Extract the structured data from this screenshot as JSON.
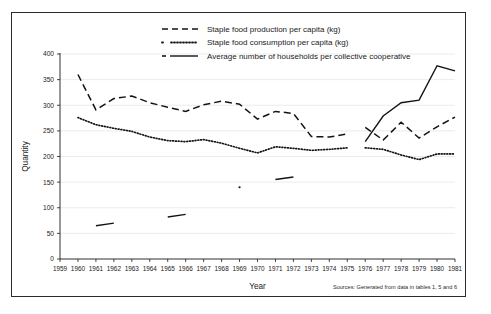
{
  "figure": {
    "axis_titles": {
      "x": "Year",
      "y": "Quantity"
    },
    "source_note": "Sources: Generated from data in tables 1, 5 and 6"
  },
  "legend": {
    "position": "top-center",
    "items": [
      {
        "key": "production",
        "style": "dashed",
        "label": "Staple food production per capita (kg)"
      },
      {
        "key": "consumption",
        "style": "dotted",
        "label": "Staple food consumption per capita (kg)"
      },
      {
        "key": "households",
        "style": "solid",
        "label": "Average number of households per collective cooperative"
      }
    ]
  },
  "chart_data": {
    "type": "line",
    "title": "",
    "xlabel": "Year",
    "ylabel": "Quantity",
    "xlim": [
      1959,
      1981
    ],
    "ylim": [
      0,
      400
    ],
    "yticks": [
      0,
      50,
      100,
      150,
      200,
      250,
      300,
      350,
      400
    ],
    "grid": true,
    "categories": [
      1959,
      1960,
      1961,
      1962,
      1963,
      1964,
      1965,
      1966,
      1967,
      1968,
      1969,
      1970,
      1971,
      1972,
      1973,
      1974,
      1975,
      1976,
      1977,
      1978,
      1979,
      1980,
      1981
    ],
    "series": [
      {
        "name": "Staple food production per capita (kg)",
        "style": "dashed",
        "x": [
          1960,
          1961,
          1962,
          1963,
          1964,
          1965,
          1966,
          1967,
          1968,
          1969,
          1970,
          1971,
          1972,
          1973,
          1974,
          1975
        ],
        "values": [
          360,
          291,
          313,
          318,
          305,
          296,
          288,
          301,
          308,
          302,
          273,
          288,
          284,
          239,
          238,
          244
        ],
        "x2": [
          1976,
          1977,
          1978,
          1979,
          1980,
          1981
        ],
        "values2": [
          257,
          232,
          267,
          236,
          258,
          277
        ],
        "break_after": 1975
      },
      {
        "name": "Staple food consumption per capita (kg)",
        "style": "dotted",
        "x": [
          1960,
          1961,
          1962,
          1963,
          1964,
          1965,
          1966,
          1967,
          1968,
          1969,
          1970,
          1971,
          1972,
          1973,
          1974,
          1975
        ],
        "values": [
          276,
          262,
          255,
          249,
          238,
          231,
          229,
          233,
          226,
          216,
          207,
          219,
          216,
          212,
          214,
          217
        ],
        "x2": [
          1976,
          1977,
          1978,
          1979,
          1980,
          1981
        ],
        "values2": [
          217,
          214,
          203,
          194,
          205,
          205
        ],
        "break_after": 1975
      },
      {
        "name": "Average number of households per collective cooperative",
        "style": "solid",
        "segments": [
          {
            "x": [
              1961,
              1962
            ],
            "values": [
              65,
              70
            ]
          },
          {
            "x": [
              1965,
              1966
            ],
            "values": [
              82,
              87
            ]
          },
          {
            "x": [
              1969
            ],
            "values": [
              140
            ]
          },
          {
            "x": [
              1971,
              1972
            ],
            "values": [
              155,
              160
            ]
          },
          {
            "x": [
              1976,
              1977,
              1978,
              1979,
              1980,
              1981
            ],
            "values": [
              229,
              279,
              305,
              310,
              377,
              367
            ]
          }
        ]
      }
    ],
    "dashed_right_segment_note": "series resume after a data break between 1975 and 1976",
    "annotations": []
  }
}
